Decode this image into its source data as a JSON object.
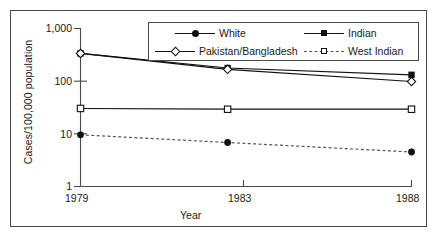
{
  "chart_data": {
    "type": "line",
    "title": "",
    "xlabel": "Year",
    "ylabel": "Cases/100,000 population",
    "x": [
      1979,
      1983,
      1988
    ],
    "xtick_labels": [
      "1979",
      "1983",
      "1988"
    ],
    "ytick_labels": [
      "1,000",
      "100",
      "10",
      "1"
    ],
    "ytick_values": [
      1000,
      100,
      10,
      1
    ],
    "yscale": "log",
    "ylim": [
      1,
      1000
    ],
    "grid": false,
    "legend_position": "top-center",
    "series": [
      {
        "name": "White",
        "marker": "filled-circle",
        "linestyle": "dashed",
        "color": "#111111",
        "values": [
          9.5,
          6.8,
          4.5
        ]
      },
      {
        "name": "Indian",
        "marker": "filled-square",
        "linestyle": "solid",
        "color": "#111111",
        "values": [
          330,
          175,
          130
        ]
      },
      {
        "name": "Pakistan/Bangladesh",
        "marker": "open-diamond",
        "linestyle": "solid",
        "color": "#111111",
        "values": [
          330,
          165,
          97
        ]
      },
      {
        "name": "West Indian",
        "marker": "open-square",
        "linestyle": "solid",
        "color": "#111111",
        "values": [
          30,
          29,
          29
        ]
      }
    ]
  },
  "legend": {
    "entries": [
      {
        "label": "White"
      },
      {
        "label": "Indian"
      },
      {
        "label": "Pakistan/Bangladesh"
      },
      {
        "label": "West Indian"
      }
    ]
  }
}
